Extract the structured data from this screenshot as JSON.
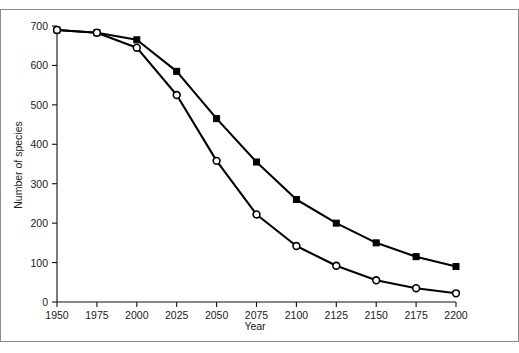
{
  "chart_data": {
    "type": "line",
    "title": "",
    "xlabel": "Year",
    "ylabel": "Number of species",
    "x": [
      1950,
      1975,
      2000,
      2025,
      2050,
      2075,
      2100,
      2125,
      2150,
      2175,
      2200
    ],
    "xlim": [
      1950,
      2200
    ],
    "ylim": [
      0,
      700
    ],
    "xticks": [
      1950,
      1975,
      2000,
      2025,
      2050,
      2075,
      2100,
      2125,
      2150,
      2175,
      2200
    ],
    "yticks": [
      0,
      100,
      200,
      300,
      400,
      500,
      600,
      700
    ],
    "xtick_labels": [
      "1950",
      "1975",
      "2000",
      "2025",
      "2050",
      "2075",
      "2100",
      "2125",
      "2150",
      "2175",
      "2200"
    ],
    "ytick_labels": [
      "0",
      "100",
      "200",
      "300",
      "400",
      "500",
      "600",
      "700"
    ],
    "grid": false,
    "legend": "none",
    "series": [
      {
        "name": "upper-series",
        "marker": "filled-square",
        "color": "#000000",
        "values": [
          690,
          683,
          665,
          585,
          465,
          355,
          260,
          200,
          150,
          115,
          90
        ]
      },
      {
        "name": "lower-series",
        "marker": "open-circle",
        "color": "#000000",
        "values": [
          690,
          683,
          645,
          525,
          358,
          222,
          142,
          92,
          55,
          35,
          22
        ]
      }
    ]
  },
  "figure": {
    "border_color": "#8c8c8c",
    "background": "#ffffff",
    "axis_color": "#111111"
  }
}
